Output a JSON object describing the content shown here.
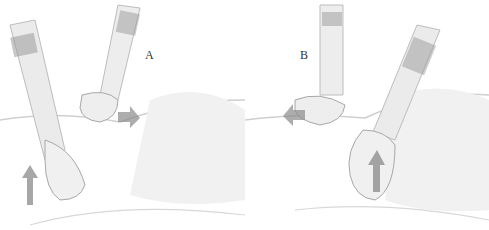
{
  "figure": {
    "panels": [
      {
        "id": "A",
        "label": "A",
        "arrows": [
          "up-arrow (lower hand pushes up)",
          "right-arrow (upper hand pulls)"
        ]
      },
      {
        "id": "B",
        "label": "B",
        "arrows": [
          "left-arrow (upper hand pulls)",
          "up-arrow (lower hand pushes up)"
        ]
      }
    ],
    "colors": {
      "background": "#ffffff",
      "pencil_dark": "#555555",
      "pencil_mid": "#999999",
      "pencil_light": "#cccccc",
      "arrow": "#8a8a8a"
    }
  }
}
